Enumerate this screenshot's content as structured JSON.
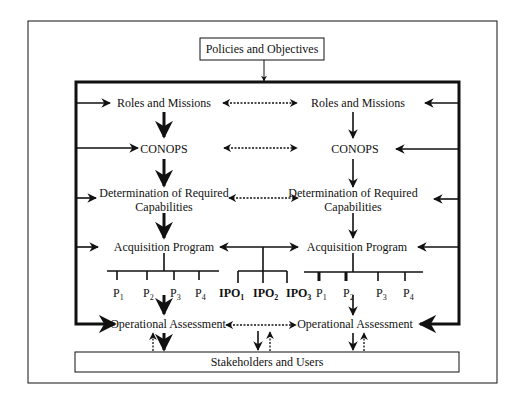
{
  "diagram": {
    "top": {
      "label": "Policies and Objectives"
    },
    "bottom": {
      "label": "Stakeholders and Users"
    },
    "left_column": {
      "roles": "Roles and Missions",
      "conops": "CONOPS",
      "capabilities_line1": "Determination of Required",
      "capabilities_line2": "Capabilities",
      "acquisition": "Acquisition Program",
      "assessment": "Operational Assessment",
      "programs": [
        {
          "base": "P",
          "sub": "1"
        },
        {
          "base": "P",
          "sub": "2"
        },
        {
          "base": "P",
          "sub": "3"
        },
        {
          "base": "P",
          "sub": "4"
        }
      ]
    },
    "right_column": {
      "roles": "Roles and Missions",
      "conops": "CONOPS",
      "capabilities_line1": "Determination of Required",
      "capabilities_line2": "Capabilities",
      "acquisition": "Acquisition Program",
      "assessment": "Operational Assessment",
      "programs": [
        {
          "base": "P",
          "sub": "1"
        },
        {
          "base": "P",
          "sub": "2"
        },
        {
          "base": "P",
          "sub": "3"
        },
        {
          "base": "P",
          "sub": "4"
        }
      ]
    },
    "ipos": [
      {
        "base": "IPO",
        "sub": "1"
      },
      {
        "base": "IPO",
        "sub": "2"
      },
      {
        "base": "IPO",
        "sub": "3"
      }
    ],
    "links": {
      "roles": "dashed-bidirectional",
      "conops": "dashed-bidirectional",
      "capabilities": "dashed-bidirectional",
      "acquisition": "solid-bidirectional",
      "assessment": "dashed-bidirectional"
    }
  }
}
